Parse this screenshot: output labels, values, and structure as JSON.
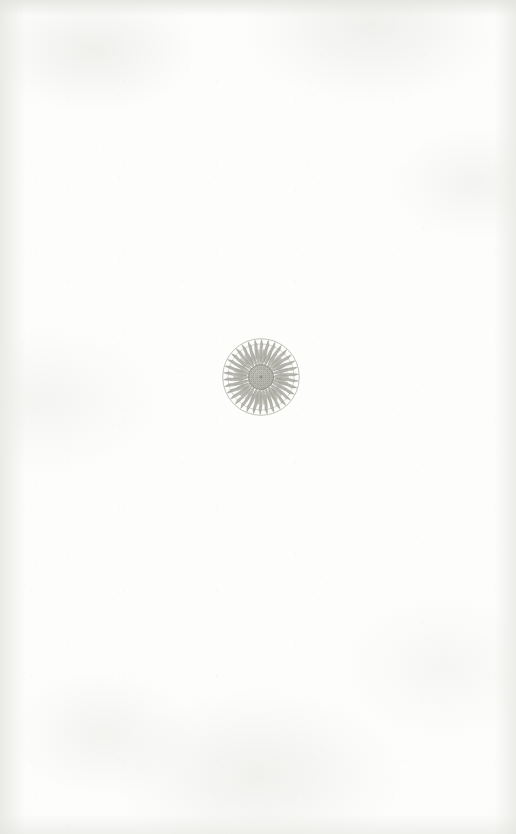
{
  "page": {
    "kind": "book-page",
    "type": "blank-divider-page",
    "width": 516,
    "height": 834,
    "paper_color": "#fdfdfc",
    "text_content": "",
    "page_number": "",
    "running_head": "",
    "body_text": ""
  },
  "ornament": {
    "name": "floral-roundel",
    "description": "Engraved circular flower medallion",
    "flower": "sunflower",
    "style": "line engraving",
    "ink_color": "#9d9d93",
    "ink_color_light": "#b9b9b1",
    "ink_color_dark": "#87877d",
    "center_x": 261,
    "center_y": 377,
    "diameter": 78,
    "outer_ring_radius": 38.5,
    "inner_ring_radius": 33.0,
    "disc_radius": 12.5,
    "petal_count": 34,
    "inner_petal_count": 26,
    "caption": "Floral roundel ornament"
  }
}
